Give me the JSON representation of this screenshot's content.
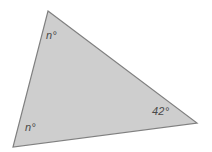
{
  "figure": {
    "type": "triangle-angle-diagram",
    "background_color": "#ffffff",
    "shape": {
      "name": "triangle",
      "fill_color": "#cecece",
      "stroke_color": "#808080",
      "stroke_width": 1.2,
      "points": "48,11 197,123 13,147",
      "vertices": [
        {
          "id": "apex",
          "x": 48,
          "y": 11
        },
        {
          "id": "right",
          "x": 197,
          "y": 123
        },
        {
          "id": "bottom_left",
          "x": 13,
          "y": 147
        }
      ]
    },
    "labels": [
      {
        "id": "apex_angle",
        "text": "n°",
        "value": "n",
        "unit": "°",
        "color": "#4a4a4a",
        "x": 46,
        "y": 30
      },
      {
        "id": "bottom_left_angle",
        "text": "n°",
        "value": "n",
        "unit": "°",
        "color": "#4a4a4a",
        "x": 25,
        "y": 122
      },
      {
        "id": "right_angle",
        "text": "42°",
        "value": "42",
        "unit": "°",
        "color": "#4a4a4a",
        "x": 152,
        "y": 106
      }
    ]
  }
}
